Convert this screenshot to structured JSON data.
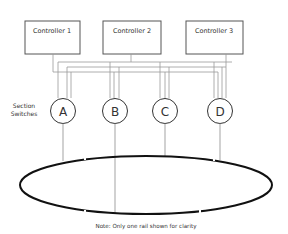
{
  "diagram": {
    "controllers": [
      {
        "label": "Controller 1"
      },
      {
        "label": "Controller 2"
      },
      {
        "label": "Controller 3"
      }
    ],
    "section_label_line1": "Section",
    "section_label_line2": "Switches",
    "switches": [
      {
        "label": "A"
      },
      {
        "label": "B"
      },
      {
        "label": "C"
      },
      {
        "label": "D"
      }
    ],
    "note": "Note: Only one rail shown for clarity",
    "colors": {
      "box_stroke": "#555555",
      "wire": "#999999",
      "rail": "#111111",
      "text": "#333333"
    }
  }
}
